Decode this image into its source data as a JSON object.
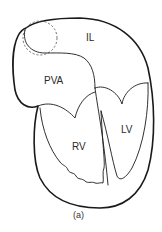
{
  "figure": {
    "caption": "(a)",
    "labels": {
      "il": "IL",
      "pva": "PVA",
      "rv": "RV",
      "lv": "LV"
    }
  }
}
